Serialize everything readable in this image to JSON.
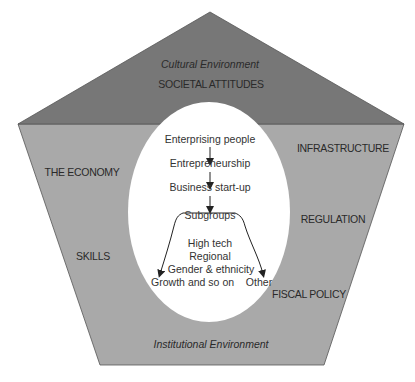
{
  "diagram": {
    "colors": {
      "top_region": "#777777",
      "lower_region": "#a9a9a9",
      "center": "#ffffff",
      "text": "#2a2a2a"
    },
    "top": {
      "environment_label": "Cultural Environment",
      "factor": "SOCIETAL ATTITUDES"
    },
    "bottom": {
      "environment_label": "Institutional Environment"
    },
    "left_factors": [
      "THE ECONOMY",
      "SKILLS"
    ],
    "right_factors": [
      "INFRASTRUCTURE",
      "REGULATION",
      "FISCAL POLICY"
    ],
    "flow": {
      "steps": [
        "Enterprising people",
        "Entrepreneurship",
        "Business start-up",
        "Subgroups"
      ],
      "subgroup_examples": [
        "High tech",
        "Regional",
        "Gender & ethnicity",
        "and so on"
      ],
      "branch_left": "Growth",
      "branch_right": "Other"
    }
  }
}
